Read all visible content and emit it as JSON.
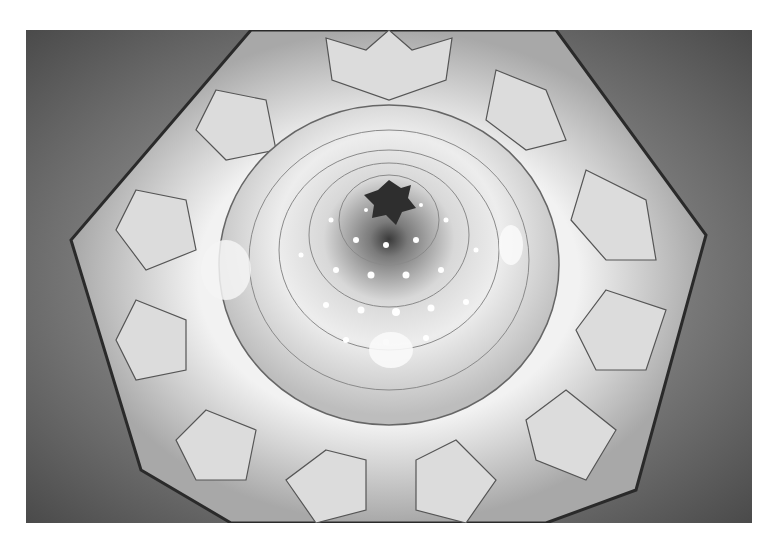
{
  "image": {
    "subject": "Muqarnas dome interior viewed from below",
    "description": "Black-and-white photograph looking up into an octagonal ceiling with layered muqarnas star patterns converging to a dark central oculus, with small round light openings.",
    "tone": "grayscale",
    "colors": {
      "background": "#ffffff",
      "wall_dark": "#4a4a4a",
      "wall_mid": "#8a8a8a",
      "muqarnas_light": "#e6e6e6",
      "center_dark": "#2e2e2e",
      "octagon_edge": "#2a2a2a"
    }
  }
}
